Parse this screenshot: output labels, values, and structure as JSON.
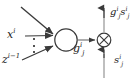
{
  "figure": {
    "type": "diagram",
    "background_color": "#ffffff",
    "stroke_color": "#3a3a3a",
    "text_color": "#1a1a1a"
  },
  "nodes": {
    "summation_node": {
      "name": "summation-node",
      "shape": "circle",
      "cx": 66,
      "cy": 40,
      "r": 11,
      "label": ""
    },
    "product_node": {
      "name": "product-node",
      "shape": "circle-with-cross",
      "symbol": "⊗",
      "cx": 104,
      "cy": 40,
      "r": 7,
      "label": ""
    }
  },
  "labels": {
    "input_x": {
      "base": "x",
      "sup": "i",
      "sub": "",
      "text": "xⁱ"
    },
    "input_z": {
      "base": "z",
      "sup": "i−1",
      "sub": "",
      "text": "zⁱ⁻¹"
    },
    "mid_g": {
      "base": "g",
      "sup": "i",
      "sub": "j",
      "text": "gⁱⱼ"
    },
    "output_gs": {
      "base_1": "g",
      "sup_1": "i",
      "sub_1": "j",
      "base_2": "s",
      "sup_2": "i",
      "sub_2": "j",
      "text": "gⁱⱼ sⁱⱼ"
    },
    "input_s": {
      "base": "s",
      "sup": "i",
      "sub": "j",
      "text": "sⁱⱼ"
    },
    "ellipsis": {
      "text": "⋮",
      "dot_count": 3
    }
  },
  "edges": [
    {
      "name": "input-arrow-top",
      "from": "top-left-offscreen",
      "to": "summation-node",
      "style": "solid-arrow"
    },
    {
      "name": "input-arrow-x",
      "from": "input_x",
      "to": "summation-node",
      "style": "solid-arrow"
    },
    {
      "name": "input-arrow-z",
      "from": "input_z",
      "to": "summation-node",
      "style": "solid-arrow"
    },
    {
      "name": "edge-g-to-product",
      "from": "summation-node",
      "to": "product-node",
      "style": "solid-arrow",
      "label": "mid_g"
    },
    {
      "name": "edge-s-into-product",
      "from": "input_s",
      "to": "product-node",
      "style": "solid-arrow-up"
    },
    {
      "name": "edge-product-output",
      "from": "product-node",
      "to": "output_gs",
      "style": "solid-arrow-up"
    }
  ]
}
